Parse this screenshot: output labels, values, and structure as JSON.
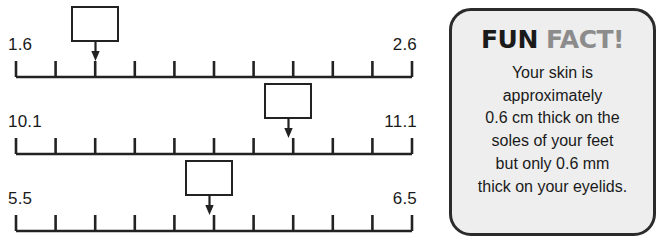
{
  "worksheet": {
    "type": "number-line-worksheet",
    "line_color": "#222222",
    "number_lines": [
      {
        "id": "number-line-1",
        "start_label": "1.6",
        "end_label": "2.6",
        "tick_count": 11,
        "interval_count": 10,
        "marked_tick_index": 2,
        "answer_box_value": ""
      },
      {
        "id": "number-line-2",
        "start_label": "10.1",
        "end_label": "11.1",
        "tick_count": 11,
        "interval_count": 10,
        "marked_tick_index": 7,
        "answer_box_value": ""
      },
      {
        "id": "number-line-3",
        "start_label": "5.5",
        "end_label": "6.5",
        "tick_count": 11,
        "interval_count": 10,
        "marked_tick_index": 5,
        "answer_box_value": ""
      }
    ]
  },
  "fun_fact": {
    "title_part_1": "FUN",
    "title_part_2": "FACT!",
    "title_color_1": "#1a1a1a",
    "title_color_2": "#8c8c8c",
    "background_color": "#eeeeee",
    "border_color": "#2b2b2b",
    "body_lines": [
      "Your skin is",
      "approximately",
      "0.6 cm thick on the",
      "soles of your feet",
      "but only 0.6 mm",
      "thick on your eyelids."
    ]
  }
}
